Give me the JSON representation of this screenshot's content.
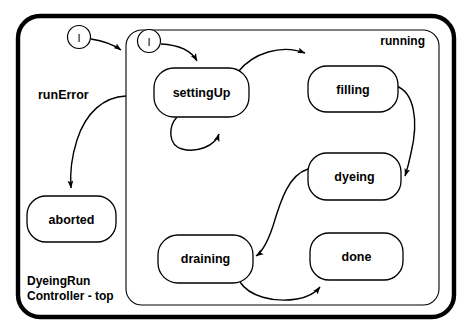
{
  "diagram": {
    "title_line1": "DyeingRun",
    "title_line2": "Controller - top",
    "stroke_color": "#000000",
    "fill_color": "#ffffff",
    "outer_frame_name": "DyeingRunController - top"
  },
  "regions": [
    {
      "id": "running",
      "label": "running"
    }
  ],
  "initial_states": [
    {
      "id": "init-top",
      "label": "I"
    },
    {
      "id": "init-running",
      "label": "I"
    }
  ],
  "states": [
    {
      "id": "aborted",
      "label": "aborted"
    },
    {
      "id": "settingUp",
      "label": "settingUp"
    },
    {
      "id": "filling",
      "label": "filling"
    },
    {
      "id": "dyeing",
      "label": "dyeing"
    },
    {
      "id": "draining",
      "label": "draining"
    },
    {
      "id": "done",
      "label": "done"
    }
  ],
  "transitions": [
    {
      "id": "t-init-running",
      "from": "init-top",
      "to": "running",
      "label": ""
    },
    {
      "id": "t-init-settingUp",
      "from": "init-running",
      "to": "settingUp",
      "label": ""
    },
    {
      "id": "t-running-aborted",
      "from": "running",
      "to": "aborted",
      "label": "runError"
    },
    {
      "id": "t-settingUp-self",
      "from": "settingUp",
      "to": "settingUp",
      "label": ""
    },
    {
      "id": "t-settingUp-filling",
      "from": "settingUp",
      "to": "filling",
      "label": ""
    },
    {
      "id": "t-filling-dyeing",
      "from": "filling",
      "to": "dyeing",
      "label": ""
    },
    {
      "id": "t-dyeing-draining",
      "from": "dyeing",
      "to": "draining",
      "label": ""
    },
    {
      "id": "t-draining-done",
      "from": "draining",
      "to": "done",
      "label": ""
    }
  ]
}
